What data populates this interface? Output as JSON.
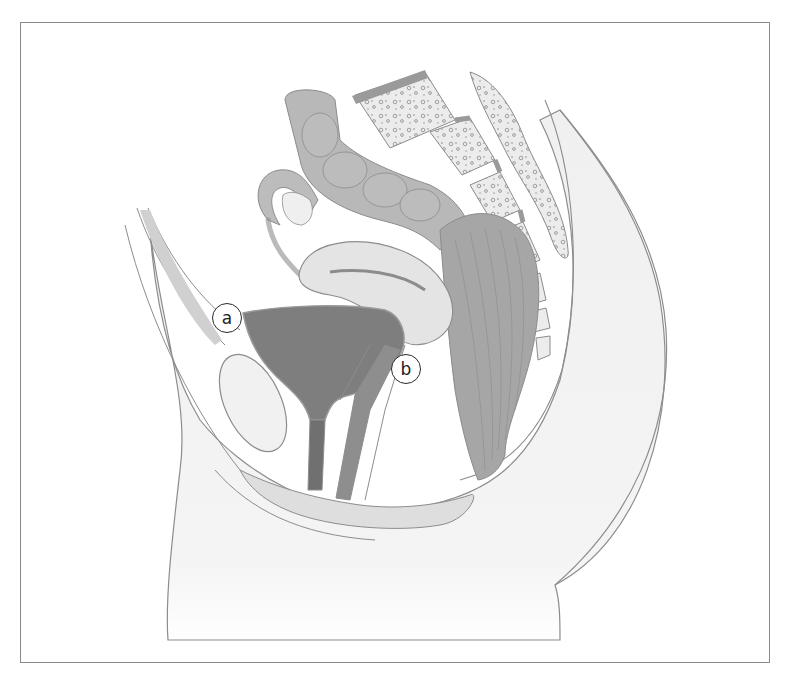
{
  "figure": {
    "type": "anatomical-illustration",
    "view": "sagittal section of female pelvis",
    "style": "grayscale",
    "frame_color": "#8a8a8a",
    "colors": {
      "outline": "#8c8c8c",
      "bladder_fill": "#7d7d7d",
      "uterus_fill": "#e2e2e2",
      "colon_fill": "#b5b5b5",
      "rectum_fill": "#a3a3a3",
      "bone_fill": "#e9e9e9",
      "body_fill": "#f2f2f2"
    }
  },
  "labels": [
    {
      "id": "a",
      "text": "a",
      "x": 227,
      "y": 318
    },
    {
      "id": "b",
      "text": "b",
      "x": 406,
      "y": 369
    }
  ]
}
